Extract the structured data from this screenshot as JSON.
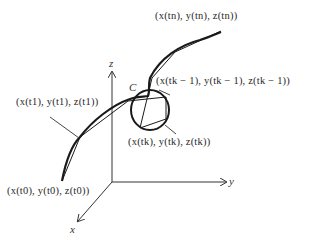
{
  "diagram": {
    "type": "space-curve-polygonal-approximation",
    "axes": {
      "x_label": "x",
      "y_label": "y",
      "z_label": "z"
    },
    "curve_label": "C",
    "points": {
      "p0": "(x(t0), y(t0), z(t0))",
      "p1": "(x(t1), y(t1), z(t1))",
      "pk_minus_1": "(x(tk − 1), y(tk − 1), z(tk − 1))",
      "pk": "(x(tk), y(tk), z(tk))",
      "pn": "(x(tn), y(tn), z(tn))"
    },
    "colors": {
      "stroke": "#1a1a1a",
      "text": "#2a2a2a",
      "background": "#ffffff"
    }
  }
}
